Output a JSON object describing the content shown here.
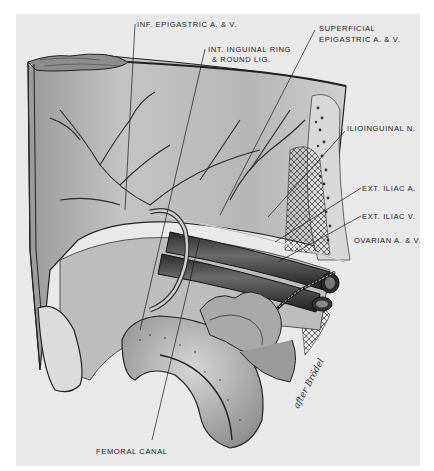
{
  "figure": {
    "type": "anatomical illustration",
    "background_color": "#e9e9e9",
    "line_color": "#1a1a1a"
  },
  "labels": [
    {
      "id": "inf-epigastric",
      "text": "INF. EPIGASTRIC A. & V."
    },
    {
      "id": "int-inguinal-ring-1",
      "text": "INT. INGUINAL RING"
    },
    {
      "id": "int-inguinal-ring-2",
      "text": "& ROUND LIG."
    },
    {
      "id": "superficial-epigastric-1",
      "text": "SUPERFICIAL"
    },
    {
      "id": "superficial-epigastric-2",
      "text": "EPIGASTRIC A. & V."
    },
    {
      "id": "ilioinguinal",
      "text": "ILIOINGUINAL N."
    },
    {
      "id": "ext-iliac-a",
      "text": "EXT. ILIAC A."
    },
    {
      "id": "ext-iliac-v",
      "text": "EXT. ILIAC V."
    },
    {
      "id": "ovarian",
      "text": "OVARIAN A. & V."
    },
    {
      "id": "femoral-canal",
      "text": "FEMORAL CANAL"
    }
  ],
  "signature": "after Brödel"
}
